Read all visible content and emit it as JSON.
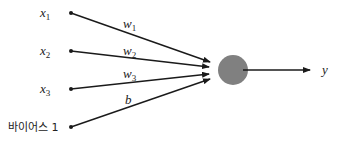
{
  "diagram": {
    "type": "perceptron",
    "inputs": [
      {
        "name": "x",
        "sub": "1",
        "weight": "w",
        "weight_sub": "1",
        "y": 13
      },
      {
        "name": "x",
        "sub": "2",
        "weight": "w",
        "weight_sub": "2",
        "y": 51
      },
      {
        "name": "x",
        "sub": "3",
        "weight": "w",
        "weight_sub": "3",
        "y": 89
      }
    ],
    "bias": {
      "label": "바이어스 1",
      "weight": "b",
      "y": 127
    },
    "neuron": {
      "cx": 233,
      "cy": 70,
      "r": 15,
      "color": "#808080"
    },
    "output": {
      "label": "y"
    }
  }
}
